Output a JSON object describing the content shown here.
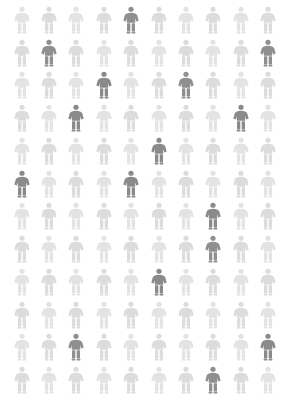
{
  "chart_data": {
    "type": "pictogram",
    "title": "",
    "subtitle": "",
    "xlabel": "",
    "ylabel": "",
    "icon": "person-icon",
    "columns": 10,
    "rows": 12,
    "total_units": 120,
    "highlighted_units": 16,
    "unhighlighted_units": 104,
    "highlighted_fraction": "16/120",
    "legend": [],
    "annotations": [],
    "grid": false,
    "colors": {
      "background": "#ffffff",
      "base": "#e3e3e3",
      "base_alt": "#dcdcdc",
      "highlight": "#8f8f8f",
      "highlight_dark": "#8a8a8a"
    },
    "categories": [
      "row-1",
      "row-2",
      "row-3",
      "row-4",
      "row-5",
      "row-6",
      "row-7",
      "row-8",
      "row-9",
      "row-10",
      "row-11",
      "row-12"
    ],
    "values": [
      1,
      2,
      2,
      2,
      1,
      2,
      1,
      1,
      1,
      0,
      2,
      1
    ],
    "series": [
      {
        "name": "highlighted",
        "values": [
          1,
          2,
          2,
          2,
          1,
          2,
          1,
          1,
          1,
          0,
          2,
          1
        ]
      },
      {
        "name": "base",
        "values": [
          9,
          8,
          8,
          8,
          9,
          8,
          9,
          9,
          9,
          10,
          8,
          9
        ]
      }
    ],
    "highlighted_positions": [
      {
        "row": 1,
        "col": 5
      },
      {
        "row": 2,
        "col": 2
      },
      {
        "row": 2,
        "col": 10
      },
      {
        "row": 3,
        "col": 4
      },
      {
        "row": 3,
        "col": 7
      },
      {
        "row": 4,
        "col": 3
      },
      {
        "row": 4,
        "col": 9
      },
      {
        "row": 5,
        "col": 6
      },
      {
        "row": 6,
        "col": 1
      },
      {
        "row": 6,
        "col": 5
      },
      {
        "row": 7,
        "col": 8
      },
      {
        "row": 8,
        "col": 8
      },
      {
        "row": 9,
        "col": 6
      },
      {
        "row": 11,
        "col": 3
      },
      {
        "row": 11,
        "col": 10
      },
      {
        "row": 12,
        "col": 8
      }
    ],
    "cells": [
      [
        "base",
        "base",
        "base",
        "base",
        "highlight",
        "base",
        "base",
        "base",
        "base",
        "base"
      ],
      [
        "base",
        "highlight",
        "base",
        "base",
        "base",
        "base",
        "base",
        "base",
        "base",
        "highlight"
      ],
      [
        "base",
        "base",
        "base",
        "highlight",
        "base",
        "base",
        "highlight",
        "base",
        "base",
        "base"
      ],
      [
        "base",
        "base",
        "highlight",
        "base",
        "base",
        "base",
        "base",
        "base",
        "highlight",
        "base"
      ],
      [
        "base",
        "base",
        "base",
        "base",
        "base",
        "highlight",
        "base",
        "base",
        "base",
        "base"
      ],
      [
        "highlight",
        "base",
        "base",
        "base",
        "highlight",
        "base",
        "base",
        "base",
        "base",
        "base"
      ],
      [
        "base",
        "base",
        "base",
        "base",
        "base",
        "base",
        "base",
        "highlight",
        "base",
        "base"
      ],
      [
        "base",
        "base",
        "base",
        "base",
        "base",
        "base",
        "base",
        "highlight",
        "base",
        "base"
      ],
      [
        "base",
        "base",
        "base",
        "base",
        "base",
        "highlight",
        "base",
        "base",
        "base",
        "base"
      ],
      [
        "base",
        "base",
        "base",
        "base",
        "base",
        "base",
        "base",
        "base",
        "base",
        "base"
      ],
      [
        "base",
        "base",
        "highlight",
        "base",
        "base",
        "base",
        "base",
        "base",
        "base",
        "highlight"
      ],
      [
        "base",
        "base",
        "base",
        "base",
        "base",
        "base",
        "base",
        "highlight",
        "base",
        "base"
      ]
    ]
  }
}
